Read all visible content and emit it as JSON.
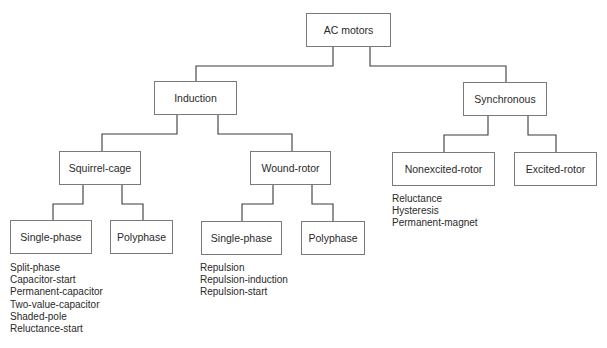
{
  "diagram": {
    "type": "tree",
    "root": {
      "label": "AC motors"
    },
    "level1": {
      "induction": {
        "label": "Induction"
      },
      "synchronous": {
        "label": "Synchronous"
      }
    },
    "level2": {
      "squirrel_cage": {
        "label": "Squirrel-cage"
      },
      "wound_rotor": {
        "label": "Wound-rotor"
      },
      "nonexcited_rotor": {
        "label": "Nonexcited-rotor"
      },
      "excited_rotor": {
        "label": "Excited-rotor"
      }
    },
    "level3": {
      "sc_single_phase": {
        "label": "Single-phase"
      },
      "sc_polyphase": {
        "label": "Polyphase"
      },
      "wr_single_phase": {
        "label": "Single-phase"
      },
      "wr_polyphase": {
        "label": "Polyphase"
      }
    },
    "lists": {
      "sc_single_phase_types": [
        "Split-phase",
        "Capacitor-start",
        "Permanent-capacitor",
        "Two-value-capacitor",
        "Shaded-pole",
        "Reluctance-start"
      ],
      "wr_single_phase_types": [
        "Repulsion",
        "Repulsion-induction",
        "Repulsion-start"
      ],
      "nonexcited_rotor_types": [
        "Reluctance",
        "Hysteresis",
        "Permanent-magnet"
      ]
    },
    "colors": {
      "line": "#3a3a3a",
      "box_border": "#7a7a7a",
      "text": "#2a2a2a",
      "background": "#ffffff"
    }
  }
}
